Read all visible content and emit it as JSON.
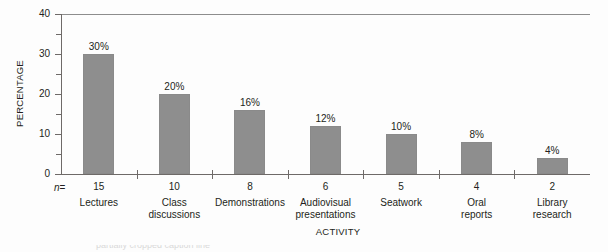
{
  "chart_data": {
    "type": "bar",
    "title": "",
    "xlabel": "ACTIVITY",
    "ylabel": "PERCENTAGE",
    "categories": [
      "Lectures",
      "Class discussions",
      "Demonstrations",
      "Audiovisual presentations",
      "Seatwork",
      "Oral reports",
      "Library research"
    ],
    "category_lines": [
      [
        "Lectures"
      ],
      [
        "Class",
        "discussions"
      ],
      [
        "Demonstrations"
      ],
      [
        "Audiovisual",
        "presentations"
      ],
      [
        "Seatwork"
      ],
      [
        "Oral",
        "reports"
      ],
      [
        "Library",
        "research"
      ]
    ],
    "values": [
      30,
      20,
      16,
      12,
      10,
      8,
      4
    ],
    "value_labels": [
      "30%",
      "20%",
      "16%",
      "12%",
      "10%",
      "8%",
      "4%"
    ],
    "n_values": [
      15,
      10,
      8,
      6,
      5,
      4,
      2
    ],
    "n_prefix": "n =",
    "n_prefix_italic": "n",
    "n_prefix_equals": "=",
    "ylim": [
      0,
      40
    ],
    "yticks": [
      0,
      10,
      20,
      30,
      40
    ],
    "ytick_labels": [
      "0",
      "10",
      "20",
      "30",
      "40"
    ],
    "yminor_ticks": [
      5,
      15,
      25,
      35
    ],
    "grid": false,
    "legend": false,
    "bar_color": "#8e8e8e",
    "axis_color": "#6e6a68",
    "background": "#fdfdfd",
    "text_color": "#231f20"
  },
  "caption": {
    "sliver_text": "partially cropped caption line"
  }
}
